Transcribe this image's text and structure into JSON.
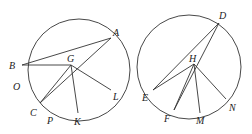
{
  "figures": [
    {
      "id": "left",
      "circle": {
        "cx": 79,
        "cy": 70,
        "r": 51
      },
      "points": {
        "A": {
          "x": 111,
          "y": 38,
          "lx": 113,
          "ly": 36
        },
        "B": {
          "x": 22,
          "y": 65,
          "lx": 9,
          "ly": 69
        },
        "O": {
          "lx": 13,
          "ly": 90
        },
        "C": {
          "x": 40,
          "y": 103,
          "lx": 30,
          "ly": 116
        },
        "P": {
          "lx": 47,
          "ly": 124
        },
        "K": {
          "x": 78,
          "y": 113,
          "lx": 74,
          "ly": 125
        },
        "L": {
          "x": 111,
          "y": 90,
          "lx": 113,
          "ly": 100
        },
        "G": {
          "x": 71,
          "y": 65,
          "lx": 67,
          "ly": 62
        }
      },
      "labels": [
        "A",
        "B",
        "O",
        "C",
        "P",
        "K",
        "L",
        "G"
      ],
      "segments": [
        [
          "B",
          "A"
        ],
        [
          "B",
          "G"
        ],
        [
          "G",
          "C"
        ],
        [
          "A",
          "C"
        ],
        [
          "G",
          "K"
        ],
        [
          "G",
          "L"
        ]
      ]
    },
    {
      "id": "right",
      "circle": {
        "cx": 189,
        "cy": 67,
        "r": 52
      },
      "points": {
        "D": {
          "x": 219,
          "y": 23,
          "lx": 219,
          "ly": 19
        },
        "E": {
          "x": 153,
          "y": 90,
          "lx": 142,
          "ly": 101
        },
        "F": {
          "x": 174,
          "y": 110,
          "lx": 164,
          "ly": 122
        },
        "M": {
          "x": 200,
          "y": 113,
          "lx": 196,
          "ly": 124
        },
        "N": {
          "x": 226,
          "y": 99,
          "lx": 229,
          "ly": 111
        },
        "H": {
          "x": 194,
          "y": 64,
          "lx": 189,
          "ly": 62
        }
      },
      "labels": [
        "D",
        "E",
        "F",
        "M",
        "N",
        "H"
      ],
      "segments": [
        [
          "E",
          "D"
        ],
        [
          "E",
          "H"
        ],
        [
          "D",
          "F"
        ],
        [
          "H",
          "F"
        ],
        [
          "H",
          "M"
        ],
        [
          "H",
          "N"
        ]
      ]
    }
  ]
}
